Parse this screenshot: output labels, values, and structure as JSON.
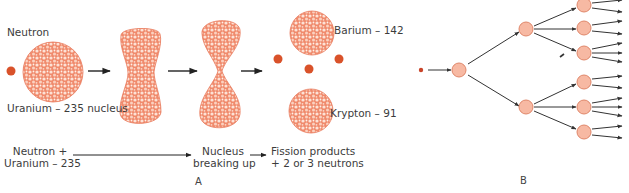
{
  "figure": {
    "panel_a": {
      "letter": "A",
      "labels": {
        "neutron": "Neutron",
        "uranium_nucleus": "Uranium – 235 nucleus",
        "barium": "Barium – 142",
        "krypton": "Krypton – 91"
      },
      "process": {
        "step1_line1": "Neutron +",
        "step1_line2": "Uranium – 235",
        "step2_line1": "Nucleus",
        "step2_line2": "breaking up",
        "step3_line1": "Fission products",
        "step3_line2": "+ 2 or 3 neutrons"
      },
      "colors": {
        "nucleus_fill": "#f08a6c",
        "nucleon_highlight": "#fde2d6",
        "neutron": "#d9522a",
        "arrow": "#222222"
      }
    },
    "panel_b": {
      "letter": "B",
      "description": "chain reaction tree",
      "generations": [
        1,
        1,
        2,
        6,
        15
      ],
      "colors": {
        "node_fill": "#f7b9a3",
        "node_stroke": "#e0876a",
        "start_dot": "#c9452a",
        "arrow": "#333333"
      }
    }
  }
}
